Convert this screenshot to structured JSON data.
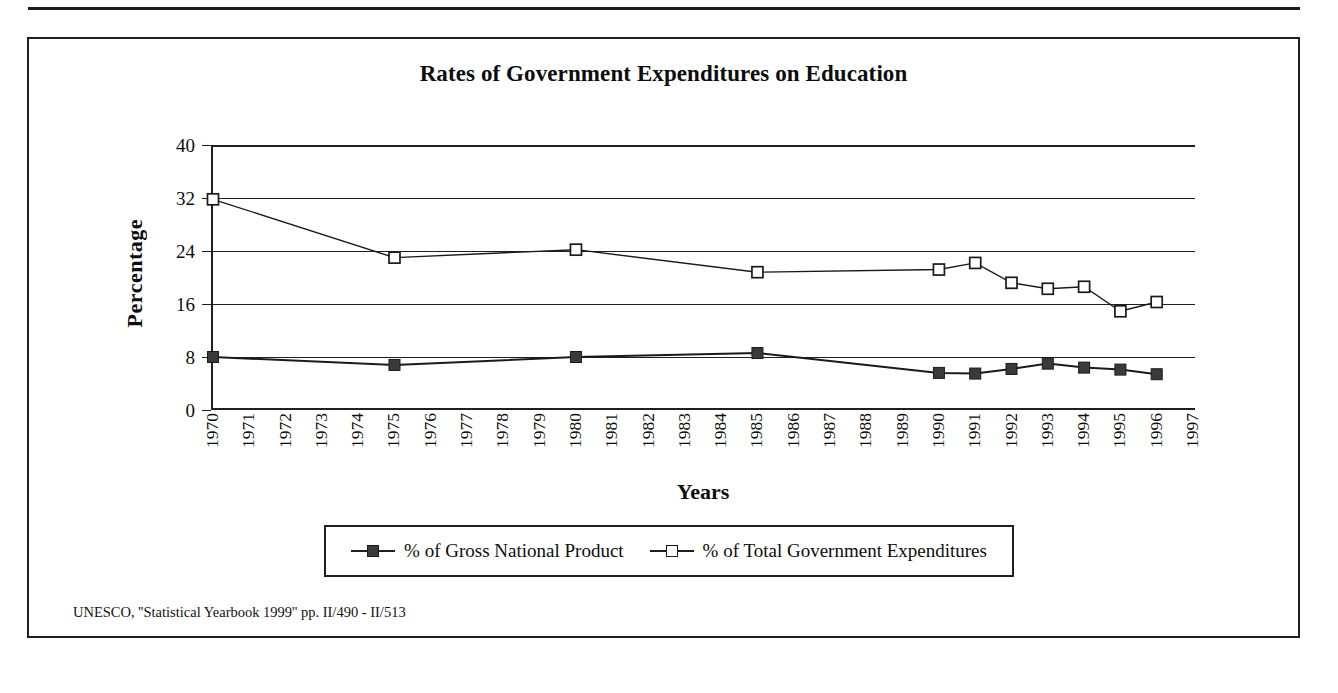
{
  "figure": {
    "title": "Rates of Government Expenditures on Education",
    "source_note": "UNESCO, ''Statistical Yearbook 1999'' pp. II/490 - II/513"
  },
  "axes": {
    "y_title": "Percentage",
    "x_title": "Years"
  },
  "legend": {
    "entries": [
      {
        "label": "% of Gross National Product",
        "marker": "filled-square",
        "color": "#3a3a3a"
      },
      {
        "label": "% of Total Government Expenditures",
        "marker": "open-square",
        "color": "#ffffff"
      }
    ]
  },
  "chart_data": {
    "type": "line",
    "title": "Rates of Government Expenditures on Education",
    "xlabel": "Years",
    "ylabel": "Percentage",
    "ylim": [
      0,
      40
    ],
    "yticks": [
      0,
      8,
      16,
      24,
      32,
      40
    ],
    "grid": true,
    "legend_position": "bottom",
    "categories": [
      "1970",
      "1971",
      "1972",
      "1973",
      "1974",
      "1975",
      "1976",
      "1977",
      "1978",
      "1979",
      "1980",
      "1981",
      "1982",
      "1983",
      "1984",
      "1985",
      "1986",
      "1987",
      "1988",
      "1989",
      "1990",
      "1991",
      "1992",
      "1993",
      "1994",
      "1995",
      "1996",
      "1997"
    ],
    "series": [
      {
        "name": "% of Gross National Product",
        "marker": "filled-square",
        "color": "#3a3a3a",
        "points": [
          {
            "x": "1970",
            "y": 8.0
          },
          {
            "x": "1975",
            "y": 6.8
          },
          {
            "x": "1980",
            "y": 8.0
          },
          {
            "x": "1985",
            "y": 8.6
          },
          {
            "x": "1990",
            "y": 5.6
          },
          {
            "x": "1991",
            "y": 5.5
          },
          {
            "x": "1992",
            "y": 6.2
          },
          {
            "x": "1993",
            "y": 7.0
          },
          {
            "x": "1994",
            "y": 6.4
          },
          {
            "x": "1995",
            "y": 6.1
          },
          {
            "x": "1996",
            "y": 5.4
          }
        ]
      },
      {
        "name": "% of Total Government Expenditures",
        "marker": "open-square",
        "color": "#ffffff",
        "points": [
          {
            "x": "1970",
            "y": 31.8
          },
          {
            "x": "1975",
            "y": 23.0
          },
          {
            "x": "1980",
            "y": 24.2
          },
          {
            "x": "1985",
            "y": 20.8
          },
          {
            "x": "1990",
            "y": 21.2
          },
          {
            "x": "1991",
            "y": 22.2
          },
          {
            "x": "1992",
            "y": 19.2
          },
          {
            "x": "1993",
            "y": 18.3
          },
          {
            "x": "1994",
            "y": 18.6
          },
          {
            "x": "1995",
            "y": 14.9
          },
          {
            "x": "1996",
            "y": 16.3
          }
        ]
      }
    ]
  }
}
